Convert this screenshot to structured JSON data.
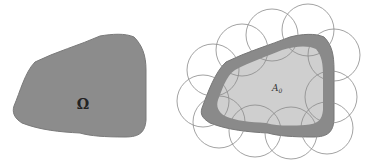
{
  "diagram": {
    "left_panel": {
      "label": "Ω",
      "fill": "#8c8c8c"
    },
    "right_panel": {
      "inner_label": "A",
      "inner_label_subscript": "0",
      "outer_band_fill": "#8a8a8a",
      "inner_fill": "#cfcfcf",
      "circle_stroke": "#8a8a8a",
      "circles": [
        {
          "cx": 213,
          "cy": 70,
          "r": 26
        },
        {
          "cx": 242,
          "cy": 50,
          "r": 26
        },
        {
          "cx": 272,
          "cy": 35,
          "r": 26
        },
        {
          "cx": 308,
          "cy": 30,
          "r": 26
        },
        {
          "cx": 334,
          "cy": 55,
          "r": 26
        },
        {
          "cx": 331,
          "cy": 97,
          "r": 26
        },
        {
          "cx": 327,
          "cy": 128,
          "r": 26
        },
        {
          "cx": 291,
          "cy": 133,
          "r": 26
        },
        {
          "cx": 255,
          "cy": 131,
          "r": 26
        },
        {
          "cx": 219,
          "cy": 122,
          "r": 26
        },
        {
          "cx": 203,
          "cy": 101,
          "r": 26
        }
      ]
    }
  }
}
